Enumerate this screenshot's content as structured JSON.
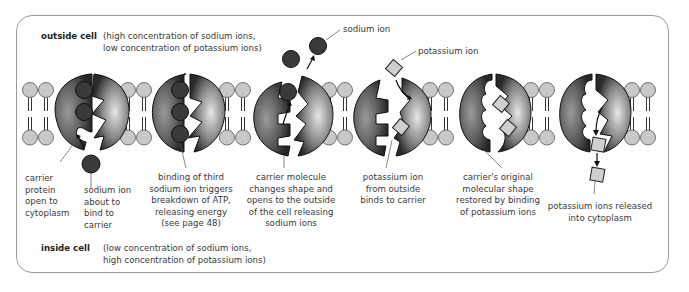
{
  "outside": {
    "title": "outside cell",
    "desc": "(high concentration of sodium ions,\nlow concentration of potassium ions)"
  },
  "inside": {
    "title": "inside cell",
    "desc": "(low concentration of sodium ions,\nhigh concentration of potassium ions)"
  },
  "callouts": {
    "sodium_ion": "sodium ion",
    "potassium_ion": "potassium ion"
  },
  "steps": [
    {
      "label": "carrier\nprotein\nopen to\ncytoplasm"
    },
    {
      "label": "sodium ion\nabout to\nbind to\ncarrier"
    },
    {
      "label": "binding of third\nsodium ion triggers\nbreakdown of ATP,\nreleasing energy\n(see page 48)"
    },
    {
      "label": "carrier molecule\nchanges shape and\nopens to the outside\nof the cell releasing\nsodium ions"
    },
    {
      "label": "potassium ion\nfrom outside\nbinds to carrier"
    },
    {
      "label": "carrier's original\nmolecular shape\nrestored by binding\nof potassium ions"
    },
    {
      "label": "potassium ions released\ninto cytoplasm"
    }
  ],
  "colors": {
    "phospholipid_head": "#c8c8c8",
    "carrier_dark": "#2e2e2e",
    "carrier_light": "#d8d8d8",
    "sodium_ion": "#3c3c3c",
    "potassium_ion": "#cfcfcf",
    "frame_border": "#9a9a9a"
  }
}
